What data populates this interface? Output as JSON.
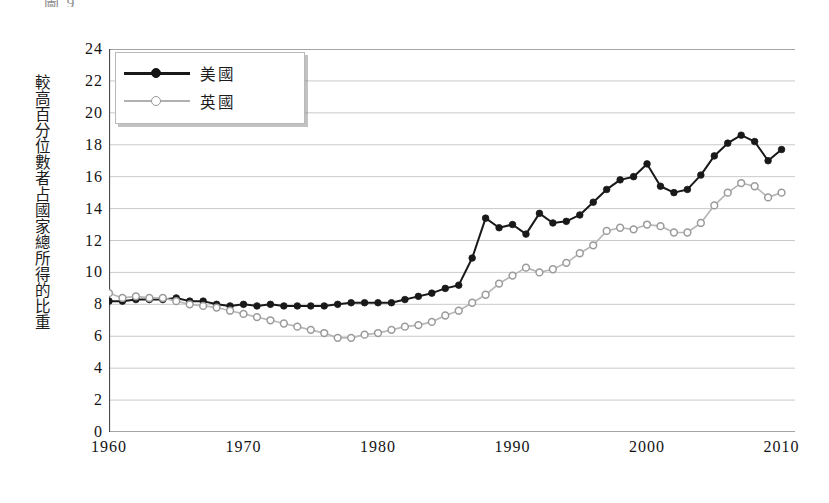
{
  "caption_fragment": "圖 9",
  "axis": {
    "y_title": "較高百分位數者占國家總所得的比重",
    "y_ticks": [
      "24",
      "22",
      "20",
      "18",
      "16",
      "14",
      "12",
      "10",
      "8",
      "6",
      "4",
      "2",
      "0"
    ],
    "x_ticks": [
      "1960",
      "1970",
      "1980",
      "1990",
      "2000",
      "2010"
    ]
  },
  "legend": {
    "us_label": "美國",
    "uk_label": "英國"
  },
  "colors": {
    "us_line": "#191919",
    "uk_line": "#b8b8b8",
    "uk_marker_edge": "#9a9a9a",
    "grid": "#bdbdbd",
    "axis": "#4a4a4a",
    "text": "#1c1c1c"
  },
  "chart_data": {
    "type": "line",
    "title": "",
    "subtitle": "",
    "xlabel": "",
    "ylabel": "較高百分位數者占國家總所得的比重",
    "xlim": [
      1960,
      2011
    ],
    "ylim": [
      0,
      24
    ],
    "y_tick_step": 2,
    "x_tick_step": 10,
    "grid": true,
    "grid_axis": "y",
    "legend_position": "top-left",
    "x": [
      1960,
      1961,
      1962,
      1963,
      1964,
      1965,
      1966,
      1967,
      1968,
      1969,
      1970,
      1971,
      1972,
      1973,
      1974,
      1975,
      1976,
      1977,
      1978,
      1979,
      1980,
      1981,
      1982,
      1983,
      1984,
      1985,
      1986,
      1987,
      1988,
      1989,
      1990,
      1991,
      1992,
      1993,
      1994,
      1995,
      1996,
      1997,
      1998,
      1999,
      2000,
      2001,
      2002,
      2003,
      2004,
      2005,
      2006,
      2007,
      2008,
      2009,
      2010
    ],
    "series": [
      {
        "name": "美國",
        "marker": "filled-circle",
        "color": "#191919",
        "values": [
          8.2,
          8.2,
          8.3,
          8.3,
          8.3,
          8.4,
          8.2,
          8.2,
          8.0,
          7.9,
          8.0,
          7.9,
          8.0,
          7.9,
          7.9,
          7.9,
          7.9,
          8.0,
          8.1,
          8.1,
          8.1,
          8.1,
          8.3,
          8.5,
          8.7,
          9.0,
          9.2,
          10.9,
          13.4,
          12.8,
          13.0,
          12.4,
          13.7,
          13.1,
          13.2,
          13.6,
          14.4,
          15.2,
          15.8,
          16.0,
          16.8,
          15.4,
          15.0,
          15.2,
          16.1,
          17.3,
          18.1,
          18.6,
          18.2,
          17.0,
          17.7
        ]
      },
      {
        "name": "英國",
        "marker": "open-circle",
        "color": "#b8b8b8",
        "values": [
          8.7,
          8.4,
          8.5,
          8.4,
          8.4,
          8.2,
          8.0,
          7.9,
          7.8,
          7.6,
          7.4,
          7.2,
          7.0,
          6.8,
          6.6,
          6.4,
          6.2,
          5.9,
          5.9,
          6.1,
          6.2,
          6.4,
          6.6,
          6.7,
          6.9,
          7.3,
          7.6,
          8.1,
          8.6,
          9.3,
          9.8,
          10.3,
          10.0,
          10.2,
          10.6,
          11.2,
          11.7,
          12.6,
          12.8,
          12.7,
          13.0,
          12.9,
          12.5,
          12.5,
          13.1,
          14.2,
          15.0,
          15.6,
          15.4,
          14.7,
          15.0
        ]
      }
    ]
  }
}
